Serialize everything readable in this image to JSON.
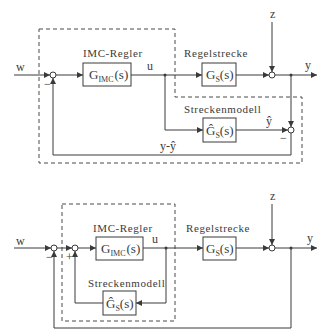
{
  "diagrams": [
    {
      "id": "top",
      "signals": {
        "input": "w",
        "control": "u",
        "disturbance": "z",
        "output": "y",
        "model_output": "ŷ",
        "difference": "y-ŷ"
      },
      "blocks": {
        "controller": {
          "label": "IMC-Regler",
          "tf_main": "G",
          "tf_sub": "IMC",
          "tf_arg": "(s)"
        },
        "plant": {
          "label": "Regelstrecke",
          "tf_main": "G",
          "tf_sub": "S",
          "tf_arg": "(s)"
        },
        "model": {
          "label": "Streckenmodell",
          "tf_main": "Ĝ",
          "tf_sub": "S",
          "tf_arg": "(s)"
        }
      },
      "signs": {
        "sum1_feedback": "−",
        "sum3_model": "−"
      }
    },
    {
      "id": "bottom",
      "signals": {
        "input": "w",
        "control": "u",
        "disturbance": "z",
        "output": "y"
      },
      "blocks": {
        "controller": {
          "label": "IMC-Regler",
          "tf_main": "G",
          "tf_sub": "IMC",
          "tf_arg": "(s)"
        },
        "plant": {
          "label": "Regelstrecke",
          "tf_main": "G",
          "tf_sub": "S",
          "tf_arg": "(s)"
        },
        "model": {
          "label": "Streckenmodell",
          "tf_main": "Ĝ",
          "tf_sub": "S",
          "tf_arg": "(s)"
        }
      },
      "signs": {
        "sumA_feedback": "−",
        "sumB_model": "+"
      }
    }
  ]
}
